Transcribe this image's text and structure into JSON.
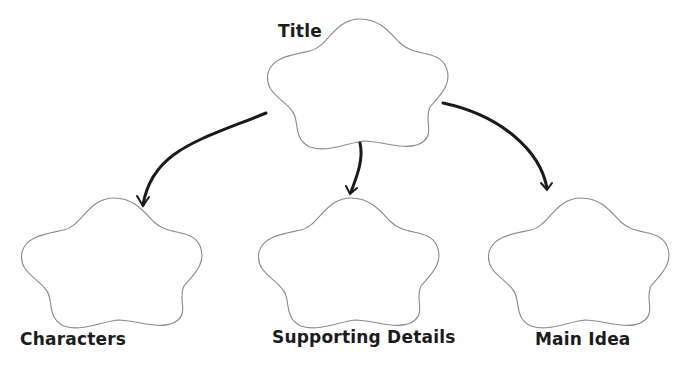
{
  "diagram": {
    "type": "graphic-organizer",
    "nodes": [
      {
        "id": "title",
        "label": "Title"
      },
      {
        "id": "characters",
        "label": "Characters"
      },
      {
        "id": "supporting",
        "label": "Supporting Details"
      },
      {
        "id": "main",
        "label": "Main Idea"
      }
    ],
    "edges": [
      {
        "from": "title",
        "to": "characters"
      },
      {
        "from": "title",
        "to": "supporting"
      },
      {
        "from": "title",
        "to": "main"
      }
    ],
    "colors": {
      "outline": "#8a8a8a",
      "arrow": "#1a1a1a",
      "text": "#1c1c1c",
      "background": "#ffffff"
    }
  }
}
